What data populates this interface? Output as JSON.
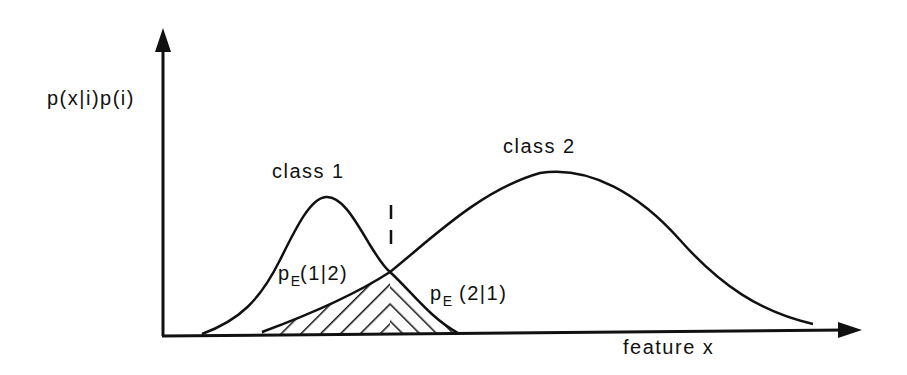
{
  "diagram": {
    "y_axis_label": "p(x|i)p(i)",
    "x_axis_label": "feature x",
    "class1_label": "class 1",
    "class2_label": "class 2",
    "error_left": {
      "p": "p",
      "sub": "E",
      "args": "(1|2)"
    },
    "error_right": {
      "p": "p",
      "sub": "E",
      "args": " (2|1)"
    },
    "colors": {
      "ink": "#111111",
      "background": "#ffffff"
    }
  }
}
